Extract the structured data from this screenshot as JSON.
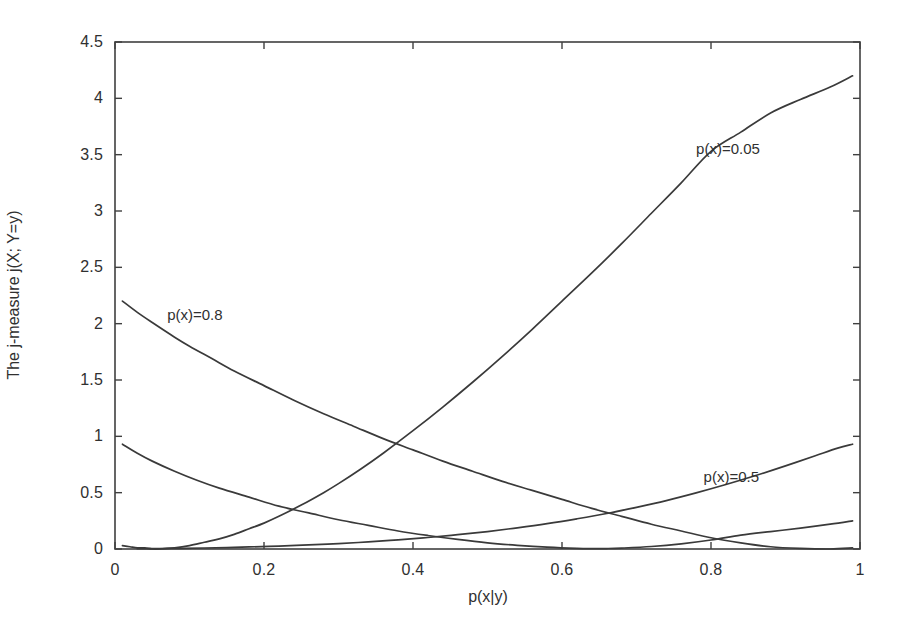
{
  "chart_data": {
    "type": "line",
    "title": "",
    "xlabel": "p(x|y)",
    "ylabel": "The j-measure j(X; Y=y)",
    "xlim": [
      0,
      1
    ],
    "ylim": [
      0,
      4.5
    ],
    "grid": false,
    "legend_position": "inline-annotations",
    "xticks": [
      "0",
      "0.2",
      "0.4",
      "0.6",
      "0.8",
      "1"
    ],
    "xtick_values": [
      0,
      0.2,
      0.4,
      0.6,
      0.8,
      1
    ],
    "yticks": [
      "0",
      "0.5",
      "1",
      "1.5",
      "2",
      "2.5",
      "3",
      "3.5",
      "4",
      "4.5"
    ],
    "ytick_values": [
      0,
      0.5,
      1,
      1.5,
      2,
      2.5,
      3,
      3.5,
      4,
      4.5
    ],
    "line_color": "#3a3a3a",
    "axis_color": "#404040",
    "background_color": "#ffffff",
    "annotations": [
      {
        "text": "p(x)=0.05",
        "x": 0.78,
        "y": 3.55
      },
      {
        "text": "p(x)=0.8",
        "x": 0.07,
        "y": 2.08
      },
      {
        "text": "p(x)=0.5",
        "x": 0.79,
        "y": 0.64
      }
    ],
    "series": [
      {
        "name": "p(x)=0.05",
        "label": "p(x)=0.05",
        "x": [
          0.01,
          0.02,
          0.03,
          0.04,
          0.05,
          0.06,
          0.08,
          0.1,
          0.12,
          0.14,
          0.16,
          0.18,
          0.2,
          0.22,
          0.25,
          0.28,
          0.3,
          0.33,
          0.36,
          0.4,
          0.44,
          0.48,
          0.52,
          0.56,
          0.6,
          0.64,
          0.68,
          0.72,
          0.76,
          0.8,
          0.84,
          0.88,
          0.92,
          0.96,
          0.99
        ],
        "y": [
          0.03,
          0.02,
          0.01,
          0.01,
          0.0,
          0.0,
          0.01,
          0.03,
          0.06,
          0.09,
          0.13,
          0.18,
          0.23,
          0.29,
          0.39,
          0.5,
          0.58,
          0.71,
          0.85,
          1.05,
          1.26,
          1.48,
          1.71,
          1.95,
          2.2,
          2.45,
          2.71,
          2.98,
          3.25,
          3.53,
          3.7,
          3.87,
          3.99,
          4.1,
          4.2
        ]
      },
      {
        "name": "p(x)=0.8",
        "label": "p(x)=0.8",
        "x": [
          0.01,
          0.03,
          0.05,
          0.08,
          0.1,
          0.13,
          0.16,
          0.2,
          0.24,
          0.28,
          0.32,
          0.36,
          0.4,
          0.44,
          0.48,
          0.52,
          0.56,
          0.6,
          0.64,
          0.68,
          0.72,
          0.76,
          0.8,
          0.84,
          0.88,
          0.92,
          0.96,
          0.99
        ],
        "y": [
          2.2,
          2.1,
          2.01,
          1.88,
          1.8,
          1.69,
          1.58,
          1.45,
          1.32,
          1.2,
          1.09,
          0.98,
          0.88,
          0.78,
          0.69,
          0.6,
          0.52,
          0.44,
          0.36,
          0.29,
          0.22,
          0.16,
          0.1,
          0.055,
          0.02,
          0.005,
          0.0,
          0.01
        ]
      },
      {
        "name": "p(x)=0.5",
        "label": "p(x)=0.5",
        "x": [
          0.01,
          0.03,
          0.05,
          0.08,
          0.11,
          0.14,
          0.18,
          0.22,
          0.26,
          0.3,
          0.34,
          0.38,
          0.42,
          0.46,
          0.5,
          0.54,
          0.58,
          0.62,
          0.64,
          0.66,
          0.68,
          0.72,
          0.76,
          0.8,
          0.84,
          0.88,
          0.92,
          0.96,
          0.99
        ],
        "y": [
          0.93,
          0.85,
          0.78,
          0.69,
          0.61,
          0.54,
          0.46,
          0.38,
          0.32,
          0.26,
          0.21,
          0.16,
          0.12,
          0.085,
          0.055,
          0.033,
          0.016,
          0.005,
          0.003,
          0.004,
          0.008,
          0.022,
          0.046,
          0.08,
          0.123,
          0.155,
          0.185,
          0.22,
          0.25
        ]
      },
      {
        "name": "p(x)=0.5-upper",
        "label": "p(x)=0.5",
        "x": [
          0.03,
          0.06,
          0.09,
          0.12,
          0.15,
          0.18,
          0.22,
          0.26,
          0.3,
          0.34,
          0.38,
          0.42,
          0.46,
          0.5,
          0.54,
          0.58,
          0.62,
          0.66,
          0.7,
          0.74,
          0.78,
          0.82,
          0.86,
          0.9,
          0.94,
          0.97,
          0.99
        ],
        "y": [
          0.002,
          0.004,
          0.006,
          0.009,
          0.013,
          0.018,
          0.026,
          0.036,
          0.048,
          0.063,
          0.081,
          0.102,
          0.127,
          0.155,
          0.188,
          0.225,
          0.268,
          0.315,
          0.37,
          0.43,
          0.498,
          0.572,
          0.652,
          0.738,
          0.828,
          0.895,
          0.93
        ]
      }
    ]
  },
  "axes": {
    "ytick_labels": [
      "4.5",
      "4",
      "3.5",
      "3",
      "2.5",
      "2",
      "1.5",
      "1",
      "0.5",
      "0"
    ],
    "xtick_labels": [
      "0",
      "0.2",
      "0.4",
      "0.6",
      "0.8",
      "1"
    ],
    "ylabel_text": "The j-measure j(X; Y=y)",
    "xlabel_text": "p(x|y)"
  },
  "annotations": {
    "a0": "p(x)=0.05",
    "a1": "p(x)=0.8",
    "a2": "p(x)=0.5"
  }
}
